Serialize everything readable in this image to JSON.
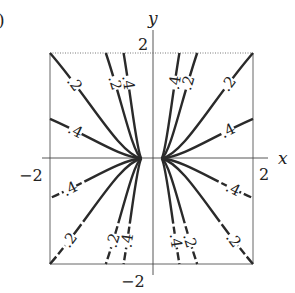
{
  "figure_label": ")",
  "chart_data": {
    "type": "line",
    "title": "",
    "xlabel": "x",
    "ylabel": "y",
    "xlim": [
      -2,
      2
    ],
    "ylim": [
      -2,
      2
    ],
    "x_ticks": [
      {
        "value": -2,
        "label": "−2"
      },
      {
        "value": 2,
        "label": "2"
      }
    ],
    "y_ticks": [
      {
        "value": 2,
        "label": "2"
      },
      {
        "value": -2,
        "label": "−2"
      }
    ],
    "grid": false,
    "frame": "dotted-top-solid-sides",
    "series": [
      {
        "name": "curve-ul-1",
        "label": ".2",
        "end": [
          -2.0,
          2.0
        ],
        "start": [
          -0.2,
          0
        ],
        "dashed_tail": false
      },
      {
        "name": "curve-ul-2",
        "label": ".4",
        "end": [
          -2.0,
          0.75
        ],
        "start": [
          -0.2,
          0
        ],
        "dashed_tail": false
      },
      {
        "name": "curve-ul-3",
        "label": ".2",
        "end": [
          -0.9,
          2.0
        ],
        "start": [
          -0.2,
          0
        ],
        "dashed_tail": false
      },
      {
        "name": "curve-ul-4",
        "label": ".4",
        "end": [
          -0.55,
          2.0
        ],
        "start": [
          -0.2,
          0
        ],
        "dashed_tail": false
      },
      {
        "name": "curve-ur-1",
        "label": ".4",
        "end": [
          0.55,
          2.0
        ],
        "start": [
          0.2,
          0
        ],
        "dashed_tail": false
      },
      {
        "name": "curve-ur-2",
        "label": ".2",
        "end": [
          0.9,
          2.0
        ],
        "start": [
          0.2,
          0
        ],
        "dashed_tail": false
      },
      {
        "name": "curve-ur-3",
        "label": ".2",
        "end": [
          2.0,
          2.0
        ],
        "start": [
          0.2,
          0
        ],
        "dashed_tail": false
      },
      {
        "name": "curve-ur-4",
        "label": ".4",
        "end": [
          2.0,
          0.75
        ],
        "start": [
          0.2,
          0
        ],
        "dashed_tail": false
      },
      {
        "name": "curve-ll-1",
        "label": ".4",
        "end": [
          -2.0,
          -0.75
        ],
        "start": [
          -0.2,
          0
        ],
        "dashed_tail": true
      },
      {
        "name": "curve-ll-2",
        "label": ".2",
        "end": [
          -2.0,
          -2.0
        ],
        "start": [
          -0.2,
          0
        ],
        "dashed_tail": true
      },
      {
        "name": "curve-ll-3",
        "label": ".2",
        "end": [
          -0.9,
          -2.0
        ],
        "start": [
          -0.2,
          0
        ],
        "dashed_tail": true
      },
      {
        "name": "curve-ll-4",
        "label": ".4",
        "end": [
          -0.55,
          -2.0
        ],
        "start": [
          -0.2,
          0
        ],
        "dashed_tail": true
      },
      {
        "name": "curve-lr-1",
        "label": ".4",
        "end": [
          0.55,
          -2.0
        ],
        "start": [
          0.2,
          0
        ],
        "dashed_tail": true
      },
      {
        "name": "curve-lr-2",
        "label": ".2",
        "end": [
          0.9,
          -2.0
        ],
        "start": [
          0.2,
          0
        ],
        "dashed_tail": true
      },
      {
        "name": "curve-lr-3",
        "label": ".2",
        "end": [
          2.0,
          -2.0
        ],
        "start": [
          0.2,
          0
        ],
        "dashed_tail": true
      },
      {
        "name": "curve-lr-4",
        "label": ".4",
        "end": [
          2.0,
          -0.75
        ],
        "start": [
          0.2,
          0
        ],
        "dashed_tail": true
      }
    ]
  }
}
